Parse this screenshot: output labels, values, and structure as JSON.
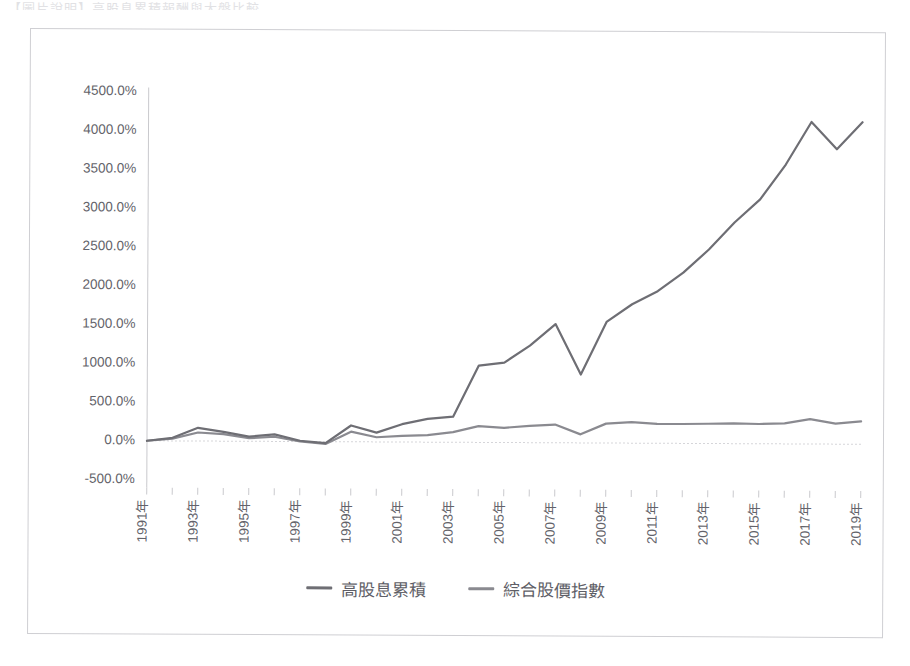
{
  "page": {
    "top_cutoff_text": "【圖片說明】高股息累積報酬與大盤比較"
  },
  "legend": {
    "position": "bottom-center",
    "items": [
      {
        "label": "高股息累積",
        "color": "#6e6e74",
        "icon": "line-swatch"
      },
      {
        "label": "綜合股價指數",
        "color": "#8a8a90",
        "icon": "line-swatch"
      }
    ]
  },
  "chart_data": {
    "type": "line",
    "title": "",
    "subtitle": "",
    "xlabel": "",
    "ylabel": "",
    "grid": false,
    "legend_position": "bottom-center",
    "ylim": [
      -500,
      4500
    ],
    "ytick_step": 500,
    "ytick_labels": [
      "4500.0%",
      "4000.0%",
      "3500.0%",
      "3000.0%",
      "2500.0%",
      "2000.0%",
      "1500.0%",
      "1000.0%",
      "500.0%",
      "0.0%",
      "-500.0%"
    ],
    "ytick_values": [
      4500,
      4000,
      3500,
      3000,
      2500,
      2000,
      1500,
      1000,
      500,
      0,
      -500
    ],
    "x": [
      "1991年",
      "1992年",
      "1993年",
      "1994年",
      "1995年",
      "1996年",
      "1997年",
      "1998年",
      "1999年",
      "2000年",
      "2001年",
      "2002年",
      "2003年",
      "2004年",
      "2005年",
      "2006年",
      "2007年",
      "2008年",
      "2009年",
      "2010年",
      "2011年",
      "2012年",
      "2013年",
      "2014年",
      "2015年",
      "2016年",
      "2017年",
      "2018年",
      "2019年"
    ],
    "xtick_labels": [
      "1991年",
      "1993年",
      "1995年",
      "1997年",
      "1999年",
      "2001年",
      "2003年",
      "2005年",
      "2007年",
      "2009年",
      "2011年",
      "2013年",
      "2015年",
      "2017年",
      "2019年"
    ],
    "xtick_label_rotation": -90,
    "xtick_label_interval": 2,
    "series": [
      {
        "name": "高股息累積",
        "color": "#6e6e74",
        "width": 2.2,
        "values": [
          0,
          40,
          170,
          120,
          60,
          90,
          10,
          -20,
          210,
          120,
          230,
          300,
          330,
          990,
          1030,
          1250,
          1530,
          880,
          1560,
          1790,
          1960,
          2200,
          2500,
          2850,
          3150,
          3600,
          4150,
          3800,
          4150
        ]
      },
      {
        "name": "綜合股價指數",
        "color": "#8a8a90",
        "width": 2.2,
        "values": [
          0,
          30,
          110,
          90,
          40,
          60,
          0,
          -30,
          130,
          60,
          80,
          90,
          130,
          210,
          190,
          215,
          235,
          110,
          250,
          270,
          250,
          250,
          255,
          260,
          255,
          265,
          320,
          265,
          295
        ]
      }
    ]
  }
}
